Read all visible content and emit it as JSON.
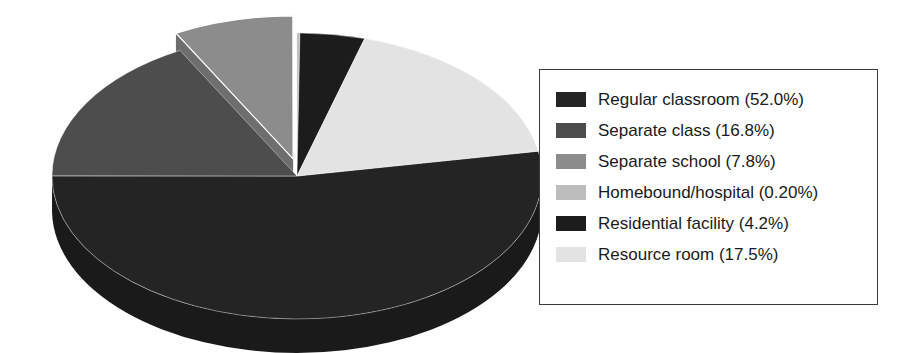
{
  "chart_data": {
    "type": "pie",
    "title": "",
    "three_d": true,
    "exploded_slices": [
      "Separate school"
    ],
    "legend_position": "right",
    "categories": [
      "Regular classroom",
      "Separate class",
      "Separate school",
      "Homebound/hospital",
      "Residential facility",
      "Resource room"
    ],
    "values": [
      52.0,
      16.8,
      7.8,
      0.2,
      4.2,
      17.5
    ],
    "value_unit": "%",
    "slices": [
      {
        "label": "Regular classroom",
        "value": 52.0,
        "display": "52.0%",
        "color": "#242424",
        "side_color": "#1a1a1a",
        "legend_text": "Regular classroom (52.0%)"
      },
      {
        "label": "Separate class",
        "value": 16.8,
        "display": "16.8%",
        "color": "#4d4d4d",
        "side_color": "#3a3a3a",
        "legend_text": "Separate class (16.8%)"
      },
      {
        "label": "Separate school",
        "value": 7.8,
        "display": "7.8%",
        "color": "#8c8c8c",
        "side_color": "#6e6e6e",
        "legend_text": "Separate school (7.8%)"
      },
      {
        "label": "Homebound/hospital",
        "value": 0.2,
        "display": "0.20%",
        "color": "#bdbdbd",
        "side_color": "#9a9a9a",
        "legend_text": "Homebound/hospital (0.20%)"
      },
      {
        "label": "Residential facility",
        "value": 4.2,
        "display": "4.2%",
        "color": "#1c1c1c",
        "side_color": "#111111",
        "legend_text": "Residential facility (4.2%)"
      },
      {
        "label": "Resource room",
        "value": 17.5,
        "display": "17.5%",
        "color": "#e3e3e3",
        "side_color": "#ababab",
        "legend_text": "Resource room (17.5%)"
      }
    ]
  },
  "legend": {
    "items": [
      {
        "text": "Regular classroom (52.0%)"
      },
      {
        "text": "Separate class (16.8%)"
      },
      {
        "text": "Separate school (7.8%)"
      },
      {
        "text": "Homebound/hospital (0.20%)"
      },
      {
        "text": "Residential facility (4.2%)"
      },
      {
        "text": "Resource room (17.5%)"
      }
    ]
  }
}
